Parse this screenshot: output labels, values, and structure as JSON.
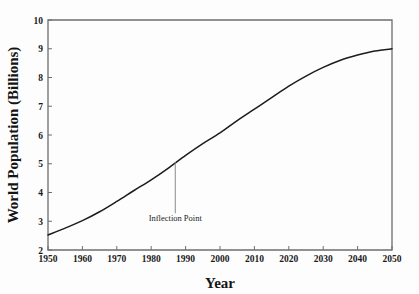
{
  "chart_data": {
    "type": "line",
    "title": "",
    "xlabel": "Year",
    "ylabel": "World Population (Billions)",
    "xlim": [
      1950,
      2050
    ],
    "ylim": [
      2,
      10
    ],
    "grid": false,
    "legend": null,
    "xticks": [
      1950,
      1960,
      1970,
      1980,
      1990,
      2000,
      2010,
      2020,
      2030,
      2040,
      2050
    ],
    "xtick_labels": [
      "1950",
      "1960",
      "1970",
      "1980",
      "1990",
      "2000",
      "2010",
      "2020",
      "2030",
      "2040",
      "2050"
    ],
    "yticks": [
      2,
      3,
      4,
      5,
      6,
      7,
      8,
      9,
      10
    ],
    "ytick_labels": [
      "2",
      "3",
      "4",
      "5",
      "6",
      "7",
      "8",
      "9",
      "10"
    ],
    "series": [
      {
        "name": "World Population",
        "x": [
          1950,
          1955,
          1960,
          1965,
          1970,
          1975,
          1980,
          1985,
          1990,
          1995,
          2000,
          2005,
          2010,
          2015,
          2020,
          2025,
          2030,
          2035,
          2040,
          2045,
          2050
        ],
        "values": [
          2.52,
          2.76,
          3.02,
          3.33,
          3.69,
          4.07,
          4.44,
          4.85,
          5.29,
          5.7,
          6.07,
          6.5,
          6.9,
          7.3,
          7.7,
          8.05,
          8.35,
          8.6,
          8.78,
          8.92,
          9.0
        ]
      }
    ],
    "annotations": [
      {
        "label": "Inflection Point",
        "point_x": 1987,
        "point_y": 5.05,
        "label_x": 1987,
        "label_y": 3.0
      }
    ]
  },
  "axes": {
    "x_title": "Year",
    "y_title": "World Population (Billions)"
  },
  "annotation": {
    "inflection_label": "Inflection Point"
  },
  "colors": {
    "line": "#1c1c1c",
    "frame": "#6e6e6e",
    "leader": "#8a8a8a",
    "background": "#fdfdfd"
  }
}
